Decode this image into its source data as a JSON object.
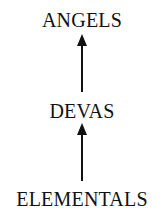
{
  "diagram": {
    "nodes": [
      {
        "id": "angels",
        "label": "ANGELS"
      },
      {
        "id": "devas",
        "label": "DEVAS"
      },
      {
        "id": "elementals",
        "label": "ELEMENTALS"
      }
    ],
    "edges": [
      {
        "from": "elementals",
        "to": "devas"
      },
      {
        "from": "devas",
        "to": "angels"
      }
    ]
  }
}
